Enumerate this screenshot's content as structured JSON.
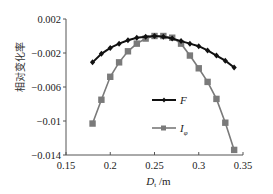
{
  "chart_data": {
    "type": "line",
    "title": "",
    "xlabel": "D_t /m",
    "xlabel_main": "D",
    "xlabel_sub": "t",
    "xlabel_unit": " /m",
    "ylabel": "相对变化率",
    "xlim": [
      0.15,
      0.35
    ],
    "ylim": [
      -0.014,
      0.002
    ],
    "xticks": [
      0.15,
      0.2,
      0.25,
      0.3,
      0.35
    ],
    "xtick_labels": [
      "0.15",
      "0.2",
      "0.25",
      "0.3",
      "0.35"
    ],
    "yticks": [
      0.002,
      -0.002,
      -0.006,
      -0.01,
      -0.014
    ],
    "ytick_labels": [
      "0.002",
      "−0.002",
      "−0.006",
      "−0.01",
      "−0.014"
    ],
    "grid": false,
    "legend_position": "inside-center-right",
    "x": [
      0.18,
      0.19,
      0.2,
      0.21,
      0.22,
      0.23,
      0.24,
      0.25,
      0.26,
      0.27,
      0.28,
      0.29,
      0.3,
      0.31,
      0.32,
      0.33,
      0.34
    ],
    "series": [
      {
        "name": "F",
        "name_main": "F",
        "name_sub": "",
        "color": "#111111",
        "marker": "diamond",
        "values": [
          -0.0031,
          -0.0021,
          -0.0014,
          -0.0009,
          -0.0005,
          -0.0002,
          -0.0001,
          0.0,
          -0.0001,
          -0.0003,
          -0.0006,
          -0.0009,
          -0.0012,
          -0.0017,
          -0.0023,
          -0.0029,
          -0.0037
        ]
      },
      {
        "name": "Iφ",
        "name_main": "I",
        "name_sub": "φ",
        "color": "#7a7a7a",
        "marker": "square",
        "values": [
          -0.0103,
          -0.0075,
          -0.0048,
          -0.0031,
          -0.0018,
          -0.0009,
          -0.0003,
          0.0,
          0.0,
          -0.0002,
          -0.0009,
          -0.0023,
          -0.0038,
          -0.0054,
          -0.0074,
          -0.0102,
          -0.0134
        ]
      }
    ]
  }
}
